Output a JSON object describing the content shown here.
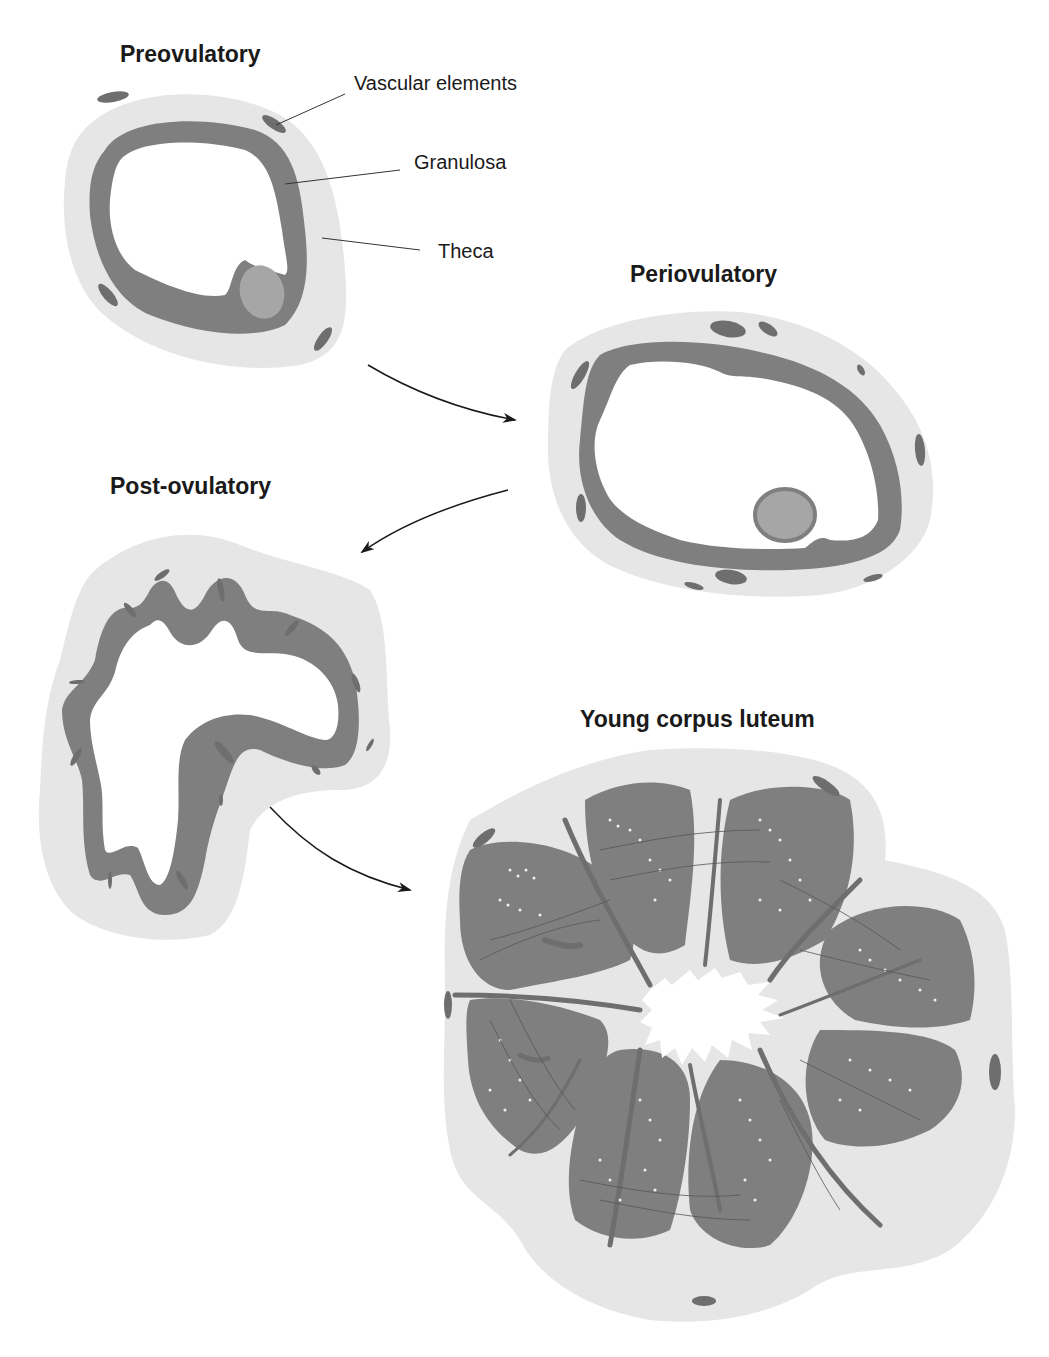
{
  "figure": {
    "stages": [
      {
        "id": "preovulatory",
        "title": "Preovulatory"
      },
      {
        "id": "periovulatory",
        "title": "Periovulatory"
      },
      {
        "id": "post-ovulatory",
        "title": "Post-ovulatory"
      },
      {
        "id": "young-corpus-luteum",
        "title": "Young corpus luteum"
      }
    ],
    "labels": {
      "vascular": "Vascular elements",
      "granulosa": "Granulosa",
      "theca": "Theca"
    },
    "colors": {
      "theca": "#e6e6e6",
      "granulosa": "#7f7f7f",
      "oocyte": "#a6a6a6",
      "vascular": "#6e6e6e",
      "antrum": "#ffffff",
      "text": "#1a1a1a"
    }
  }
}
